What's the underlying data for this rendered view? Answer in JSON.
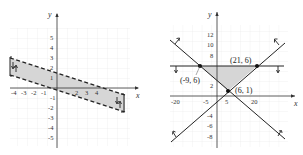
{
  "graph_left": {
    "x_axis_label": "x",
    "y_axis_label": "y",
    "x_ticks": [
      "-4",
      "-3",
      "-2",
      "-1",
      "2",
      "3",
      "4"
    ],
    "y_ticks": [
      "5",
      "4",
      "3",
      "2",
      "1",
      "-1",
      "-2",
      "-3",
      "-4",
      "-5"
    ],
    "boundary_style": "dashed",
    "region": "shaded band between two parallel dashed lines",
    "colors": {
      "shade": "#d9d9d9",
      "line": "#222222",
      "grid": "#e6e6e6"
    }
  },
  "graph_right": {
    "x_axis_label": "x",
    "y_axis_label": "y",
    "x_ticks": [
      "-20",
      "-5",
      "5",
      "20"
    ],
    "y_ticks": [
      "12",
      "10",
      "8",
      "2",
      "-4",
      "-6",
      "-8"
    ],
    "boundary_style": "solid",
    "points": [
      {
        "label": "(-9, 6)",
        "x": -9,
        "y": 6
      },
      {
        "label": "(21, 6)",
        "x": 21,
        "y": 6
      },
      {
        "label": "(6, 1)",
        "x": 6,
        "y": 1
      }
    ],
    "region": "shaded triangle with vertices (-9,6), (21,6), (6,1)",
    "colors": {
      "shade": "#d9d9d9",
      "line": "#222222",
      "grid": "#e6e6e6"
    }
  }
}
